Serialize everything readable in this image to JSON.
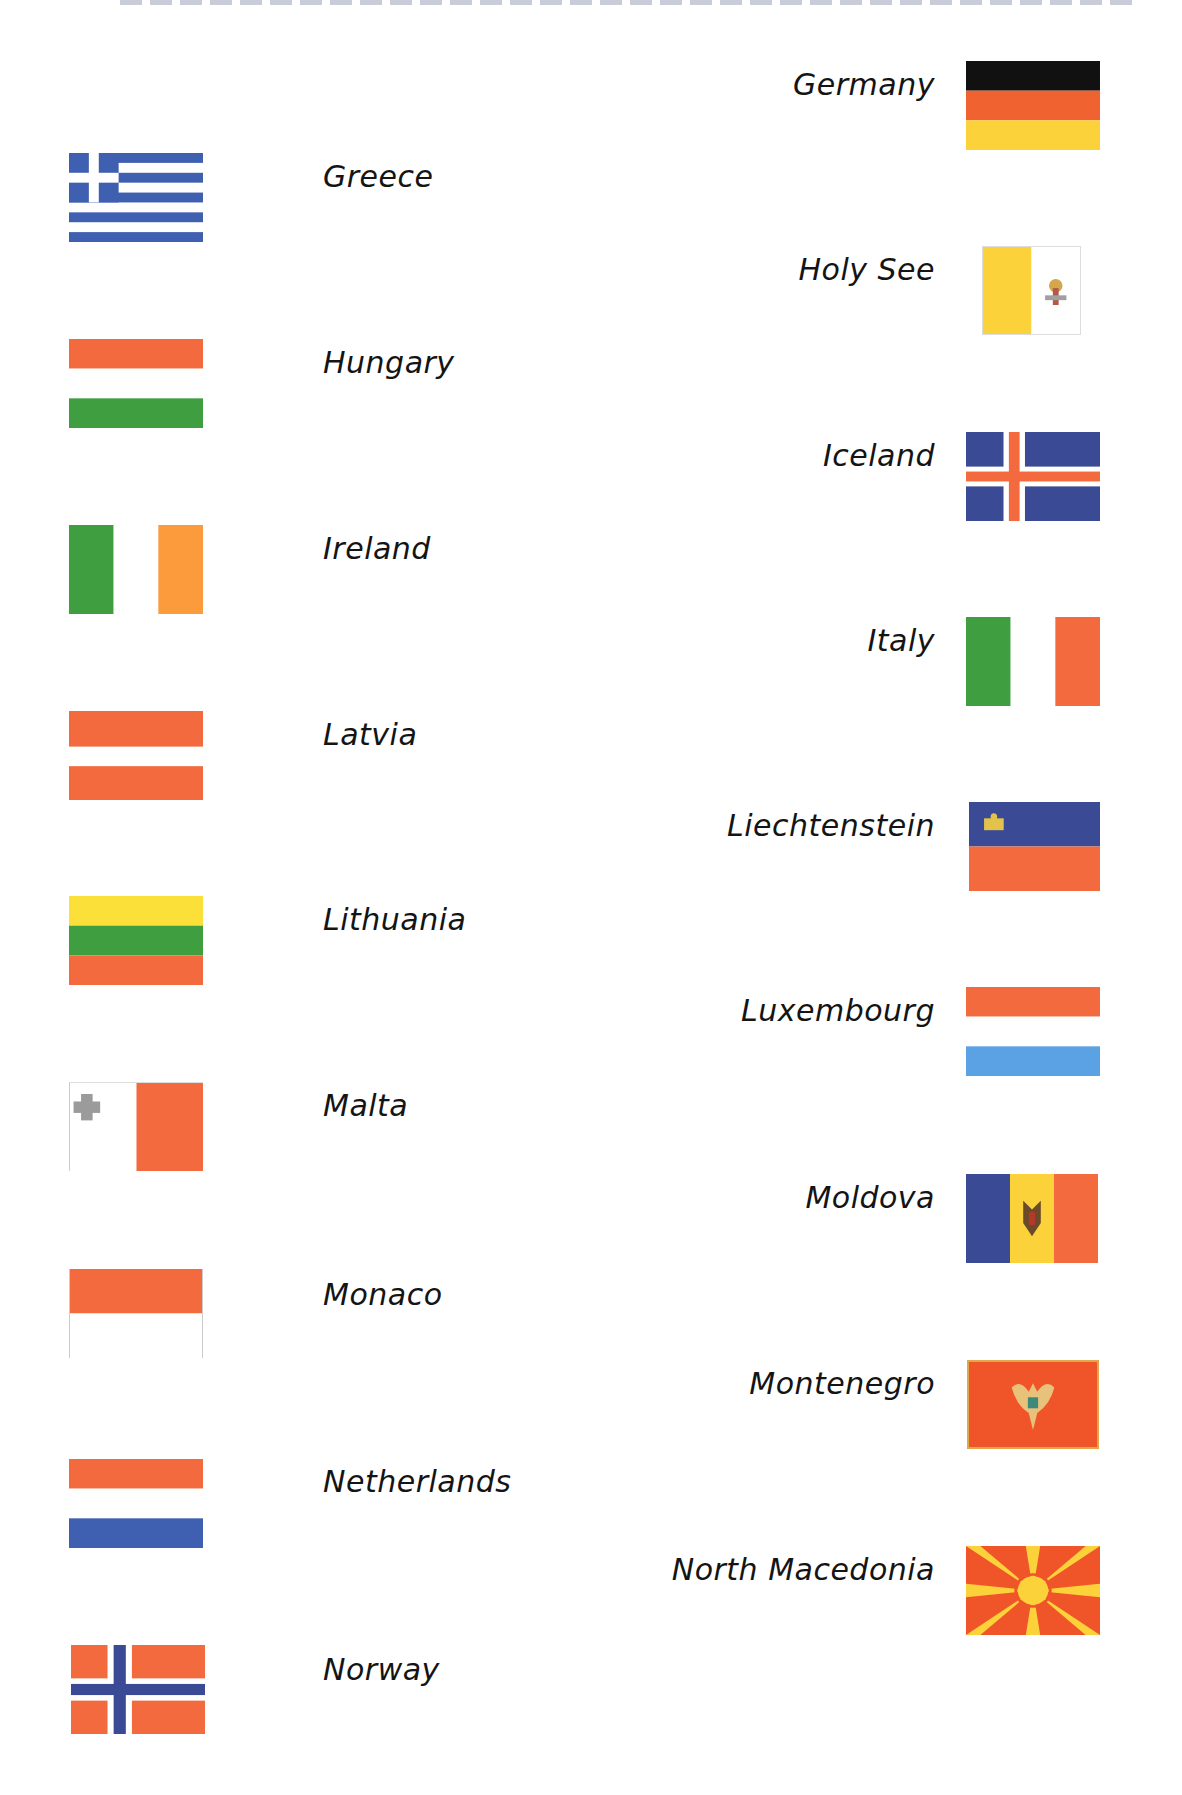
{
  "heading": {
    "visible_text": ""
  },
  "colors": {
    "red": "#f26a3d",
    "blue": "#3b4a94",
    "green": "#3f9e3f",
    "yellow": "#fcd23a",
    "orange": "#fb9b3c",
    "black": "#111111",
    "light_blue": "#5aa2e4",
    "white": "#ffffff"
  },
  "left_column": [
    {
      "country": "Greece",
      "flag": "greece-flag"
    },
    {
      "country": "Hungary",
      "flag": "hungary-flag"
    },
    {
      "country": "Ireland",
      "flag": "ireland-flag"
    },
    {
      "country": "Latvia",
      "flag": "latvia-flag"
    },
    {
      "country": "Lithuania",
      "flag": "lithuania-flag"
    },
    {
      "country": "Malta",
      "flag": "malta-flag"
    },
    {
      "country": "Monaco",
      "flag": "monaco-flag"
    },
    {
      "country": "Netherlands",
      "flag": "netherlands-flag"
    },
    {
      "country": "Norway",
      "flag": "norway-flag"
    }
  ],
  "right_column": [
    {
      "country": "Germany",
      "flag": "germany-flag"
    },
    {
      "country": "Holy See",
      "flag": "holy-see-flag"
    },
    {
      "country": "Iceland",
      "flag": "iceland-flag"
    },
    {
      "country": "Italy",
      "flag": "italy-flag"
    },
    {
      "country": "Liechtenstein",
      "flag": "liechtenstein-flag"
    },
    {
      "country": "Luxembourg",
      "flag": "luxembourg-flag"
    },
    {
      "country": "Moldova",
      "flag": "moldova-flag"
    },
    {
      "country": "Montenegro",
      "flag": "montenegro-flag"
    },
    {
      "country": "North Macedonia",
      "flag": "north-macedonia-flag"
    }
  ]
}
